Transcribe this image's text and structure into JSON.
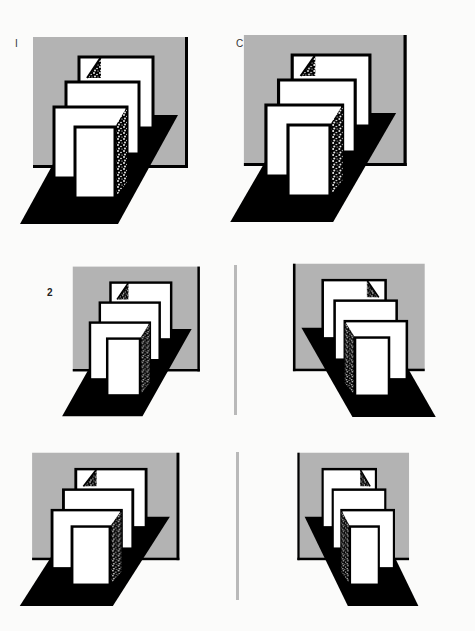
{
  "labels": {
    "row1_left": "I",
    "row1_right": "C",
    "row2": "2",
    "row3": "3"
  },
  "colors": {
    "background": "#fbfbfa",
    "backdrop_gray": "#b3b3b3",
    "floor_black": "#000000",
    "panel_white": "#ffffff",
    "divider_gray": "#b9b9b9"
  },
  "figures": [
    {
      "name": "figure-1-left",
      "row": 1,
      "side": "left",
      "mirrored": false
    },
    {
      "name": "figure-1-right-c",
      "row": 1,
      "side": "right",
      "mirrored": false
    },
    {
      "name": "figure-2-left",
      "row": 2,
      "side": "left",
      "mirrored": false
    },
    {
      "name": "figure-2-right",
      "row": 2,
      "side": "right",
      "mirrored": true
    },
    {
      "name": "figure-3-left",
      "row": 3,
      "side": "left",
      "mirrored": false
    },
    {
      "name": "figure-3-right",
      "row": 3,
      "side": "right",
      "mirrored": true
    }
  ]
}
